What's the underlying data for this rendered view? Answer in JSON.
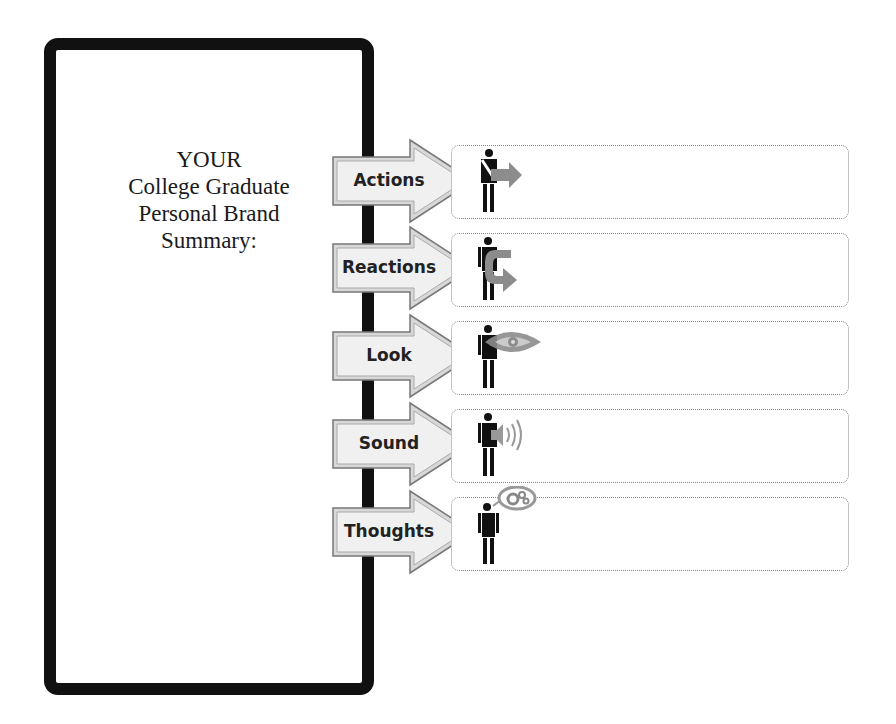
{
  "summary": {
    "title_lines": [
      "YOUR",
      "College Graduate",
      "Personal Brand",
      "Summary:"
    ]
  },
  "rows": [
    {
      "label": "Actions",
      "icon": "person-arrow-right-icon",
      "value": ""
    },
    {
      "label": "Reactions",
      "icon": "person-u-turn-arrow-icon",
      "value": ""
    },
    {
      "label": "Look",
      "icon": "person-eye-icon",
      "value": ""
    },
    {
      "label": "Sound",
      "icon": "person-speaker-icon",
      "value": ""
    },
    {
      "label": "Thoughts",
      "icon": "person-thought-bubble-icon",
      "value": ""
    }
  ],
  "colors": {
    "frame": "#111111",
    "arrow_fill": "#eeeeee",
    "arrow_border": "#8a8a8a",
    "icon_gray": "#8c8c8c",
    "box_border": "#888888"
  }
}
